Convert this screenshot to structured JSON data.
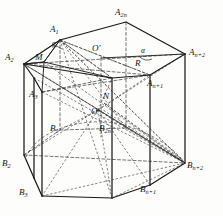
{
  "figure": {
    "type": "geometry-diagram",
    "background_color": "#fdfdfb",
    "line_color": "#1a1a1a",
    "vertices": [
      {
        "id": "A1",
        "label": "A",
        "sub": "1",
        "x": 56,
        "y": 33
      },
      {
        "id": "A2n",
        "label": "A",
        "sub": "2n",
        "x": 121,
        "y": 16
      },
      {
        "id": "An2",
        "label": "A",
        "sub": "n+2",
        "x": 194,
        "y": 55
      },
      {
        "id": "A2",
        "label": "A",
        "sub": "2",
        "x": 13,
        "y": 60
      },
      {
        "id": "A3",
        "label": "A",
        "sub": "3",
        "x": 34,
        "y": 97
      },
      {
        "id": "An1",
        "label": "A",
        "sub": "n+1",
        "x": 152,
        "y": 86
      },
      {
        "id": "B1",
        "label": "B",
        "sub": "1",
        "x": 54,
        "y": 131
      },
      {
        "id": "B2n",
        "label": "B",
        "sub": "2n",
        "x": 104,
        "y": 131
      },
      {
        "id": "B2",
        "label": "B",
        "sub": "2",
        "x": 4,
        "y": 166
      },
      {
        "id": "B3",
        "label": "B",
        "sub": "3",
        "x": 22,
        "y": 195
      },
      {
        "id": "Bn1",
        "label": "B",
        "sub": "n+1",
        "x": 145,
        "y": 192
      },
      {
        "id": "Bn2",
        "label": "B",
        "sub": "n+2",
        "x": 191,
        "y": 168
      }
    ],
    "points": [
      {
        "id": "Oprime",
        "label": "O′",
        "x": 97,
        "y": 51
      },
      {
        "id": "N",
        "label": "N",
        "x": 106,
        "y": 98
      },
      {
        "id": "O",
        "label": "O",
        "x": 94,
        "y": 113
      },
      {
        "id": "M",
        "label": "M",
        "x": 39,
        "y": 59
      },
      {
        "id": "R",
        "label": "R",
        "x": 138,
        "y": 65
      },
      {
        "id": "alpha_left",
        "label": "α",
        "x": 47,
        "y": 45
      },
      {
        "id": "alpha_right",
        "label": "α",
        "x": 144,
        "y": 51
      }
    ],
    "label_count": 19
  }
}
